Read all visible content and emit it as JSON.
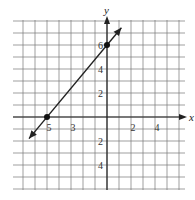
{
  "chart_data": {
    "type": "line",
    "title": "",
    "xlabel": "x",
    "ylabel": "y",
    "xlim": [
      -7.8,
      6.5
    ],
    "ylim": [
      -6,
      8
    ],
    "grid": true,
    "x_tick_labels": [
      {
        "value": -5,
        "label": "5"
      },
      {
        "value": -3,
        "label": "3"
      },
      {
        "value": 2,
        "label": "2"
      },
      {
        "value": 4,
        "label": "4"
      }
    ],
    "y_tick_labels": [
      {
        "value": 6,
        "label": "6"
      },
      {
        "value": 4,
        "label": "4"
      },
      {
        "value": 2,
        "label": "2"
      },
      {
        "value": -2,
        "label": "2"
      },
      {
        "value": -4,
        "label": "4"
      }
    ],
    "series": [
      {
        "name": "line",
        "equation": "y = (6/5)x + 6",
        "x": [
          -6.5,
          1.2
        ],
        "y": [
          -1.8,
          7.44
        ]
      }
    ],
    "points": [
      {
        "x": -5,
        "y": 0
      },
      {
        "x": 0,
        "y": 6
      }
    ]
  }
}
